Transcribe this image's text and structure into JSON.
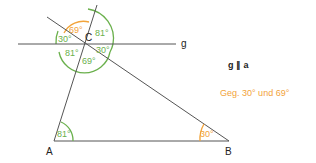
{
  "diagram": {
    "type": "geometry",
    "points": {
      "A": {
        "label": "A",
        "x": 54,
        "y": 141
      },
      "B": {
        "label": "B",
        "x": 229,
        "y": 141
      },
      "C": {
        "label": "C",
        "x": 84,
        "y": 44
      }
    },
    "lines": {
      "g": {
        "label": "g"
      }
    },
    "angles": {
      "at_A": "81°",
      "at_B": "30°",
      "C_top": "69°",
      "C_upper_right": "81°",
      "C_right": "30°",
      "C_left": "30°",
      "C_lower_left": "81°",
      "C_bottom": "69°"
    },
    "colors": {
      "green": "#6ab04c",
      "orange": "#f2a33a",
      "line": "#555555"
    }
  },
  "notes": {
    "parallel": "g ∥ a",
    "given": "Geg. 30° und 69°"
  }
}
